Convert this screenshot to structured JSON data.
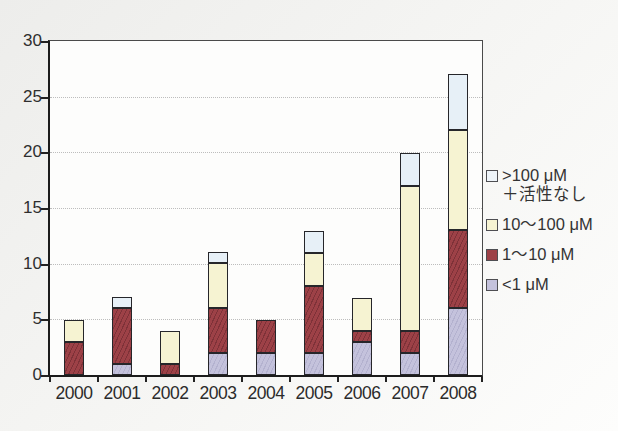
{
  "chart_data": {
    "type": "bar",
    "stacked": true,
    "title": "",
    "xlabel": "",
    "ylabel": "",
    "categories": [
      "2000",
      "2001",
      "2002",
      "2003",
      "2004",
      "2005",
      "2006",
      "2007",
      "2008"
    ],
    "series": [
      {
        "name": "<1 μM",
        "color": "#c4c2dc",
        "values": [
          0,
          1,
          0,
          2,
          2,
          2,
          3,
          2,
          6
        ]
      },
      {
        "name": "1～10 μM",
        "color": "#9d4147",
        "values": [
          3,
          5,
          1,
          4,
          3,
          6,
          1,
          2,
          7
        ]
      },
      {
        "name": "10～100 μM",
        "color": "#f6f3d2",
        "values": [
          2,
          0,
          3,
          4,
          0,
          3,
          3,
          13,
          9
        ]
      },
      {
        "name": ">100 μM ＋活性なし",
        "color": "#e7f0f7",
        "values": [
          0,
          1,
          0,
          1,
          0,
          2,
          0,
          3,
          5
        ]
      }
    ],
    "totals": [
      5,
      7,
      4,
      11,
      5,
      13,
      7,
      20,
      27
    ],
    "ylim": [
      0,
      30
    ],
    "yticks": [
      "0",
      "5",
      "10",
      "15",
      "20",
      "25",
      "30"
    ],
    "grid": "horizontal dotted",
    "legend_position": "right, outside plot"
  },
  "legend": {
    "items": [
      {
        "lines": [
          ">100 μM",
          "＋活性なし"
        ],
        "color": "#eef4f9",
        "series_index": 3
      },
      {
        "lines": [
          "10～100 μM"
        ],
        "color": "#f6f3d2",
        "series_index": 2
      },
      {
        "lines": [
          "1～10 μM"
        ],
        "color": "#9d4147",
        "series_index": 1
      },
      {
        "lines": [
          "<1 μM"
        ],
        "color": "#c4c2dc",
        "series_index": 0
      }
    ]
  },
  "colors": {
    "page_background": "#f2f2f0",
    "plot_background": "#fdfdfc",
    "axis": "#1c1c1c",
    "gridline": "#bdbdbd",
    "text": "#2e2e2e"
  }
}
